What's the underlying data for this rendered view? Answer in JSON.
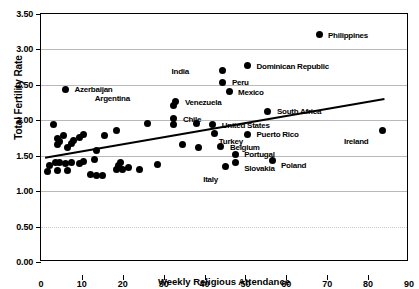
{
  "chart_data": {
    "type": "scatter",
    "title": "",
    "xlabel": "Weekly Religious Attendance",
    "ylabel": "Total Fertility Rate",
    "xlim": [
      0,
      90
    ],
    "ylim": [
      0.0,
      3.5
    ],
    "xticks": [
      "0",
      "10",
      "20",
      "30",
      "40",
      "50",
      "60",
      "70",
      "80",
      "90"
    ],
    "yticks": [
      "0.00",
      "0.50",
      "1.00",
      "1.50",
      "2.00",
      "2.50",
      "3.00",
      "3.50"
    ],
    "grid": "horizontal",
    "legend": "none",
    "trendline": {
      "type": "linear",
      "x_start": 1.0,
      "y_start": 1.47,
      "x_end": 84.0,
      "y_end": 2.3
    },
    "labeled_points": [
      {
        "label": "Philippines",
        "x": 68.0,
        "y": 3.21,
        "label_dx": 9,
        "label_dy": -3
      },
      {
        "label": "Dominican Republic",
        "x": 50.5,
        "y": 2.77,
        "label_dx": 9,
        "label_dy": -3
      },
      {
        "label": "India",
        "x": 44.5,
        "y": 2.7,
        "label_dx": -32,
        "label_dy": -3
      },
      {
        "label": "Peru",
        "x": 44.5,
        "y": 2.54,
        "label_dx": 9,
        "label_dy": -3
      },
      {
        "label": "Mexico",
        "x": 46.0,
        "y": 2.4,
        "label_dx": 9,
        "label_dy": -3
      },
      {
        "label": "Azerbaijan",
        "x": 6.0,
        "y": 2.44,
        "label_dx": 9,
        "label_dy": -3
      },
      {
        "label": "Argentina",
        "x": 32.5,
        "y": 2.21,
        "label_dx": -42,
        "label_dy": -10
      },
      {
        "label": "Venezuela",
        "x": 33.0,
        "y": 2.26,
        "label_dx": 9,
        "label_dy": -3
      },
      {
        "label": "Chile",
        "x": 32.5,
        "y": 2.02,
        "label_dx": 9,
        "label_dy": -3
      },
      {
        "label": "South Africa",
        "x": 55.5,
        "y": 2.13,
        "label_dx": 9,
        "label_dy": -3
      },
      {
        "label": "United States",
        "x": 42.0,
        "y": 1.94,
        "label_dx": 9,
        "label_dy": -3
      },
      {
        "label": "Turkey",
        "x": 42.5,
        "y": 1.81,
        "label_dx": 4,
        "label_dy": 4
      },
      {
        "label": "Puerto Rico",
        "x": 50.5,
        "y": 1.8,
        "label_dx": 9,
        "label_dy": -3
      },
      {
        "label": "Ireland",
        "x": 83.5,
        "y": 1.86,
        "label_dx": -12,
        "label_dy": 8
      },
      {
        "label": "Belgium",
        "x": 44.0,
        "y": 1.63,
        "label_dx": 9,
        "label_dy": -3
      },
      {
        "label": "Portugal",
        "x": 47.5,
        "y": 1.52,
        "label_dx": 9,
        "label_dy": -3
      },
      {
        "label": "Poland",
        "x": 56.5,
        "y": 1.43,
        "label_dx": 9,
        "label_dy": 1
      },
      {
        "label": "Slovakia",
        "x": 47.5,
        "y": 1.4,
        "label_dx": 9,
        "label_dy": 2
      },
      {
        "label": "Italy",
        "x": 45.0,
        "y": 1.35,
        "label_dx": -5,
        "label_dy": 10
      }
    ],
    "unlabeled_points": [
      {
        "x": 3.0,
        "y": 1.94
      },
      {
        "x": 4.0,
        "y": 1.74
      },
      {
        "x": 4.5,
        "y": 1.7
      },
      {
        "x": 4.0,
        "y": 1.66
      },
      {
        "x": 5.5,
        "y": 1.79
      },
      {
        "x": 7.5,
        "y": 1.67
      },
      {
        "x": 8.0,
        "y": 1.72
      },
      {
        "x": 9.5,
        "y": 1.76
      },
      {
        "x": 10.5,
        "y": 1.8
      },
      {
        "x": 6.5,
        "y": 1.62
      },
      {
        "x": 2.0,
        "y": 1.36
      },
      {
        "x": 3.5,
        "y": 1.4
      },
      {
        "x": 4.5,
        "y": 1.4
      },
      {
        "x": 6.0,
        "y": 1.39
      },
      {
        "x": 7.5,
        "y": 1.41
      },
      {
        "x": 9.5,
        "y": 1.39
      },
      {
        "x": 10.5,
        "y": 1.42
      },
      {
        "x": 1.5,
        "y": 1.28
      },
      {
        "x": 4.0,
        "y": 1.29
      },
      {
        "x": 6.5,
        "y": 1.29
      },
      {
        "x": 13.5,
        "y": 1.57
      },
      {
        "x": 15.5,
        "y": 1.79
      },
      {
        "x": 13.0,
        "y": 1.44
      },
      {
        "x": 12.0,
        "y": 1.24
      },
      {
        "x": 13.5,
        "y": 1.22
      },
      {
        "x": 15.0,
        "y": 1.22
      },
      {
        "x": 18.5,
        "y": 1.86
      },
      {
        "x": 19.5,
        "y": 1.4
      },
      {
        "x": 19.0,
        "y": 1.36
      },
      {
        "x": 20.0,
        "y": 1.3
      },
      {
        "x": 18.5,
        "y": 1.3
      },
      {
        "x": 21.5,
        "y": 1.33
      },
      {
        "x": 24.0,
        "y": 1.31
      },
      {
        "x": 28.5,
        "y": 1.37
      },
      {
        "x": 32.5,
        "y": 1.94
      },
      {
        "x": 34.5,
        "y": 1.66
      },
      {
        "x": 38.0,
        "y": 1.95
      },
      {
        "x": 38.5,
        "y": 1.61
      },
      {
        "x": 26.0,
        "y": 1.95
      }
    ]
  },
  "axes": {
    "y_title": "Total Fertility Rate",
    "x_title": "Weekly Religious Attendance"
  }
}
